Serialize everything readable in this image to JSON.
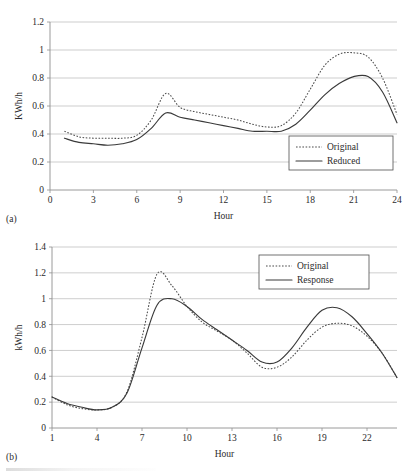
{
  "figures": [
    {
      "id": "a",
      "panel_label": "(a)",
      "chart_data": {
        "type": "line",
        "title": "",
        "xlabel": "Hour",
        "ylabel": "KWh/h",
        "xlim": [
          0,
          24
        ],
        "ylim": [
          0,
          1.2
        ],
        "grid": true,
        "legend_position": "bottom-right",
        "xticks": [
          "0",
          "3",
          "6",
          "9",
          "12",
          "15",
          "18",
          "21",
          "24"
        ],
        "xtick_values": [
          0,
          3,
          6,
          9,
          12,
          15,
          18,
          21,
          24
        ],
        "yticks": [
          "0",
          "0.2",
          "0.4",
          "0.6",
          "0.8",
          "1",
          "1.2"
        ],
        "ytick_values": [
          0,
          0.2,
          0.4,
          0.6,
          0.8,
          1,
          1.2
        ],
        "x": [
          1,
          2,
          3,
          4,
          5,
          6,
          7,
          8,
          9,
          10,
          11,
          12,
          13,
          14,
          15,
          16,
          17,
          18,
          19,
          20,
          21,
          22,
          23,
          24
        ],
        "series": [
          {
            "name": "Original",
            "style": "dotted",
            "values": [
              0.42,
              0.38,
              0.37,
              0.37,
              0.37,
              0.39,
              0.5,
              0.69,
              0.59,
              0.56,
              0.54,
              0.52,
              0.5,
              0.47,
              0.45,
              0.46,
              0.55,
              0.72,
              0.89,
              0.97,
              0.98,
              0.95,
              0.8,
              0.54
            ]
          },
          {
            "name": "Reduced",
            "style": "solid",
            "values": [
              0.37,
              0.34,
              0.33,
              0.32,
              0.33,
              0.36,
              0.44,
              0.55,
              0.52,
              0.5,
              0.48,
              0.46,
              0.44,
              0.42,
              0.42,
              0.42,
              0.47,
              0.57,
              0.68,
              0.76,
              0.81,
              0.81,
              0.7,
              0.48
            ]
          }
        ]
      }
    },
    {
      "id": "b",
      "panel_label": "(b)",
      "chart_data": {
        "type": "line",
        "title": "",
        "xlabel": "Hour",
        "ylabel": "kWh/h",
        "xlim": [
          1,
          24
        ],
        "ylim": [
          0,
          1.4
        ],
        "grid": true,
        "legend_position": "top-right",
        "xticks": [
          "1",
          "4",
          "7",
          "10",
          "13",
          "16",
          "19",
          "22"
        ],
        "xtick_values": [
          1,
          4,
          7,
          10,
          13,
          16,
          19,
          22
        ],
        "yticks": [
          "0",
          "0.2",
          "0.4",
          "0.6",
          "0.8",
          "1",
          "1.2",
          "1.4"
        ],
        "ytick_values": [
          0,
          0.2,
          0.4,
          0.6,
          0.8,
          1,
          1.2,
          1.4
        ],
        "x": [
          1,
          2,
          3,
          4,
          5,
          6,
          7,
          8,
          9,
          10,
          11,
          12,
          13,
          14,
          15,
          16,
          17,
          18,
          19,
          20,
          21,
          22,
          23,
          24
        ],
        "series": [
          {
            "name": "Original",
            "style": "dotted",
            "values": [
              0.24,
              0.18,
              0.15,
              0.14,
              0.16,
              0.28,
              0.7,
              1.19,
              1.1,
              0.94,
              0.82,
              0.75,
              0.68,
              0.58,
              0.47,
              0.47,
              0.55,
              0.68,
              0.78,
              0.81,
              0.79,
              0.71,
              0.58,
              0.39
            ]
          },
          {
            "name": "Response",
            "style": "solid",
            "values": [
              0.24,
              0.19,
              0.16,
              0.14,
              0.16,
              0.27,
              0.62,
              0.95,
              1.0,
              0.94,
              0.84,
              0.76,
              0.68,
              0.6,
              0.51,
              0.51,
              0.62,
              0.78,
              0.91,
              0.93,
              0.86,
              0.73,
              0.58,
              0.39
            ]
          }
        ]
      }
    }
  ]
}
